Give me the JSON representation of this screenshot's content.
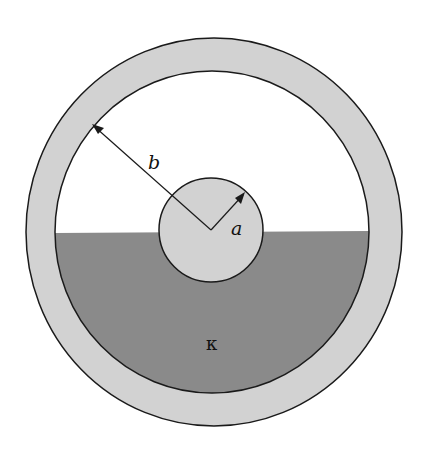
{
  "diagram": {
    "labels": {
      "outer_radius": "b",
      "inner_radius": "a",
      "dielectric": "κ"
    },
    "colors": {
      "conductor": "#d2d2d2",
      "dielectric": "#8a8a8a",
      "empty": "#ffffff",
      "stroke": "#1a1a1a"
    }
  }
}
